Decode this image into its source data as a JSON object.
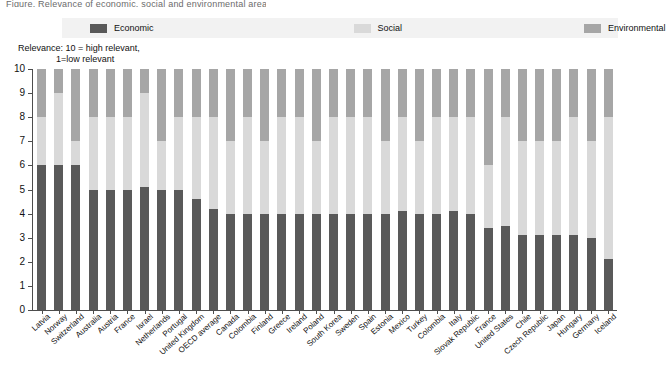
{
  "cut_title": "Figure. Relevance of economic, social and environmental areas",
  "legend": {
    "items": [
      {
        "label": "Economic",
        "color": "#595959",
        "icon": "legend-swatch-icon"
      },
      {
        "label": "Social",
        "color": "#d9d9d9",
        "icon": "legend-swatch-icon"
      },
      {
        "label": "Environmental",
        "color": "#a6a6a6",
        "icon": "legend-swatch-icon"
      }
    ],
    "background": "#f2f2f2"
  },
  "axis_note": {
    "line1": "Relevance: 10  = high  relevant,",
    "line2": "1=low relevant"
  },
  "chart_data": {
    "type": "bar",
    "stacked": true,
    "title": "",
    "subtitle": "Relevance: 10 = high relevant, 1=low relevant",
    "xlabel": "",
    "ylabel": "",
    "ylim": [
      0,
      10
    ],
    "ytick_labels": [
      "0",
      "1",
      "2",
      "3",
      "4",
      "5",
      "6",
      "7",
      "8",
      "9",
      "10"
    ],
    "grid": true,
    "legend_position": "top",
    "colors": {
      "Economic": "#595959",
      "Social": "#d9d9d9",
      "Environmental": "#a6a6a6"
    },
    "categories": [
      "Latvia",
      "Norway",
      "Switzerland",
      "Australia",
      "Austria",
      "France",
      "Israel",
      "Netherlands",
      "Portugal",
      "United Kingdom",
      "OECD average",
      "Canada",
      "Colombia",
      "Finland",
      "Greece",
      "Ireland",
      "Poland",
      "South Korea",
      "Sweden",
      "Spain",
      "Estonia",
      "Mexico",
      "Turkey",
      "Colombia",
      "Italy",
      "Slovak Republic",
      "France",
      "United States",
      "Chile",
      "Czech Republic",
      "Japan",
      "Hungary",
      "Germany",
      "Iceland"
    ],
    "series": [
      {
        "name": "Economic",
        "values": [
          6,
          6,
          6,
          5,
          5,
          5,
          5.1,
          5,
          5,
          4.6,
          4.2,
          4,
          4,
          4,
          4,
          4,
          4,
          4,
          4,
          4,
          4,
          4.1,
          4,
          4,
          4.1,
          4,
          3.4,
          3.5,
          3.1,
          3.1,
          3.1,
          3.1,
          3,
          2.1
        ]
      },
      {
        "name": "Social",
        "values": [
          2,
          3,
          1,
          3,
          3,
          3,
          3.9,
          2,
          3,
          3.4,
          3.8,
          3,
          4,
          3,
          4,
          4,
          3,
          4,
          4,
          4,
          3,
          3.9,
          3,
          4,
          3.9,
          4,
          2.6,
          4.5,
          3.9,
          3.9,
          3.9,
          4.9,
          4,
          5.9
        ]
      },
      {
        "name": "Environmental",
        "values": [
          2,
          1,
          3,
          2,
          2,
          2,
          1,
          3,
          2,
          2,
          2,
          3,
          2,
          3,
          2,
          2,
          3,
          2,
          2,
          2,
          3,
          2,
          3,
          2,
          2,
          2,
          4,
          2,
          3,
          3,
          3,
          2,
          3,
          2
        ]
      }
    ]
  }
}
